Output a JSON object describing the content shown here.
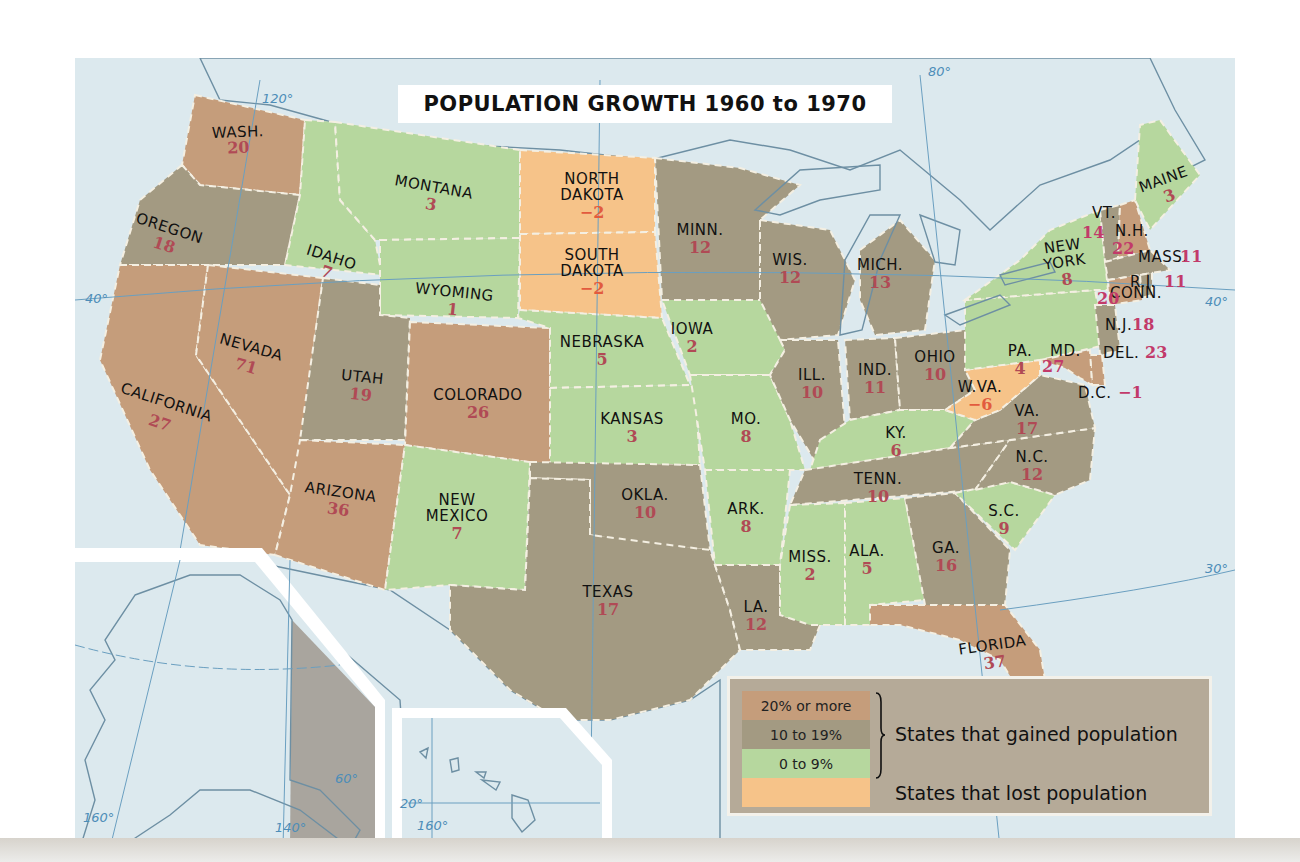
{
  "title": "POPULATION GROWTH 1960 to 1970",
  "colors": {
    "gain_20_plus": "#c59d7b",
    "gain_10_19": "#a39a82",
    "gain_0_9": "#b6d79e",
    "loss": "#f6c389",
    "water": "#dce9ee",
    "foreign_land": "#a9a59e",
    "value_text": "#b04a55"
  },
  "legend": {
    "items": [
      {
        "label": "20% or more",
        "category": "gain_20_plus"
      },
      {
        "label": "10 to 19%",
        "category": "gain_10_19"
      },
      {
        "label": "0 to 9%",
        "category": "gain_0_9"
      },
      {
        "label": "",
        "category": "loss"
      }
    ],
    "gained_label": "States that gained population",
    "lost_label": "States that lost population"
  },
  "graticule_labels": {
    "lon_120": "120°",
    "lon_80": "80°",
    "lat_40_west": "40°",
    "lat_40_east": "40°",
    "lat_30": "30°",
    "ak_160": "160°",
    "ak_140": "140°",
    "ak_60": "60°",
    "hi_20": "20°",
    "hi_160": "160°"
  },
  "states": [
    {
      "name": "WASH.",
      "value": "20",
      "category": "gain_20_plus"
    },
    {
      "name": "OREGON",
      "value": "18",
      "category": "gain_10_19"
    },
    {
      "name": "CALIFORNIA",
      "value": "27",
      "category": "gain_20_plus"
    },
    {
      "name": "IDAHO",
      "value": "7",
      "category": "gain_0_9"
    },
    {
      "name": "NEVADA",
      "value": "71",
      "category": "gain_20_plus"
    },
    {
      "name": "MONTANA",
      "value": "3",
      "category": "gain_0_9"
    },
    {
      "name": "WYOMING",
      "value": "1",
      "category": "gain_0_9"
    },
    {
      "name": "UTAH",
      "value": "19",
      "category": "gain_10_19"
    },
    {
      "name": "COLORADO",
      "value": "26",
      "category": "gain_20_plus"
    },
    {
      "name": "ARIZONA",
      "value": "36",
      "category": "gain_20_plus"
    },
    {
      "name": "NEW MEXICO",
      "value": "7",
      "category": "gain_0_9"
    },
    {
      "name": "NORTH DAKOTA",
      "value": "−2",
      "category": "loss"
    },
    {
      "name": "SOUTH DAKOTA",
      "value": "−2",
      "category": "loss"
    },
    {
      "name": "NEBRASKA",
      "value": "5",
      "category": "gain_0_9"
    },
    {
      "name": "KANSAS",
      "value": "3",
      "category": "gain_0_9"
    },
    {
      "name": "OKLA.",
      "value": "10",
      "category": "gain_10_19"
    },
    {
      "name": "TEXAS",
      "value": "17",
      "category": "gain_10_19"
    },
    {
      "name": "MINN.",
      "value": "12",
      "category": "gain_10_19"
    },
    {
      "name": "IOWA",
      "value": "2",
      "category": "gain_0_9"
    },
    {
      "name": "MO.",
      "value": "8",
      "category": "gain_0_9"
    },
    {
      "name": "ARK.",
      "value": "8",
      "category": "gain_0_9"
    },
    {
      "name": "LA.",
      "value": "12",
      "category": "gain_10_19"
    },
    {
      "name": "WIS.",
      "value": "12",
      "category": "gain_10_19"
    },
    {
      "name": "ILL.",
      "value": "10",
      "category": "gain_10_19"
    },
    {
      "name": "MICH.",
      "value": "13",
      "category": "gain_10_19"
    },
    {
      "name": "IND.",
      "value": "11",
      "category": "gain_10_19"
    },
    {
      "name": "OHIO",
      "value": "10",
      "category": "gain_10_19"
    },
    {
      "name": "KY.",
      "value": "6",
      "category": "gain_0_9"
    },
    {
      "name": "TENN.",
      "value": "10",
      "category": "gain_10_19"
    },
    {
      "name": "MISS.",
      "value": "2",
      "category": "gain_0_9"
    },
    {
      "name": "ALA.",
      "value": "5",
      "category": "gain_0_9"
    },
    {
      "name": "GA.",
      "value": "16",
      "category": "gain_10_19"
    },
    {
      "name": "FLORIDA",
      "value": "37",
      "category": "gain_20_plus"
    },
    {
      "name": "S.C.",
      "value": "9",
      "category": "gain_0_9"
    },
    {
      "name": "N.C.",
      "value": "12",
      "category": "gain_10_19"
    },
    {
      "name": "VA.",
      "value": "17",
      "category": "gain_10_19"
    },
    {
      "name": "W.VA.",
      "value": "−6",
      "category": "loss"
    },
    {
      "name": "PA.",
      "value": "4",
      "category": "gain_0_9"
    },
    {
      "name": "NEW YORK",
      "value": "8",
      "category": "gain_0_9"
    },
    {
      "name": "VT.",
      "value": "14",
      "category": "gain_10_19"
    },
    {
      "name": "N.H.",
      "value": "22",
      "category": "gain_20_plus"
    },
    {
      "name": "MAINE",
      "value": "3",
      "category": "gain_0_9"
    },
    {
      "name": "MASS.",
      "value": "11",
      "category": "gain_10_19"
    },
    {
      "name": "R.I.",
      "value": "11",
      "category": "gain_10_19"
    },
    {
      "name": "CONN.",
      "value": "20",
      "category": "gain_20_plus"
    },
    {
      "name": "N.J.",
      "value": "18",
      "category": "gain_10_19"
    },
    {
      "name": "DEL.",
      "value": "23",
      "category": "gain_20_plus"
    },
    {
      "name": "MD.",
      "value": "27",
      "category": "gain_20_plus"
    },
    {
      "name": "D.C.",
      "value": "−1",
      "category": "loss"
    },
    {
      "name": "ALASKA",
      "value": "34",
      "category": "gain_20_plus"
    },
    {
      "name": "HAWAII",
      "value": "22",
      "category": "gain_20_plus"
    }
  ]
}
